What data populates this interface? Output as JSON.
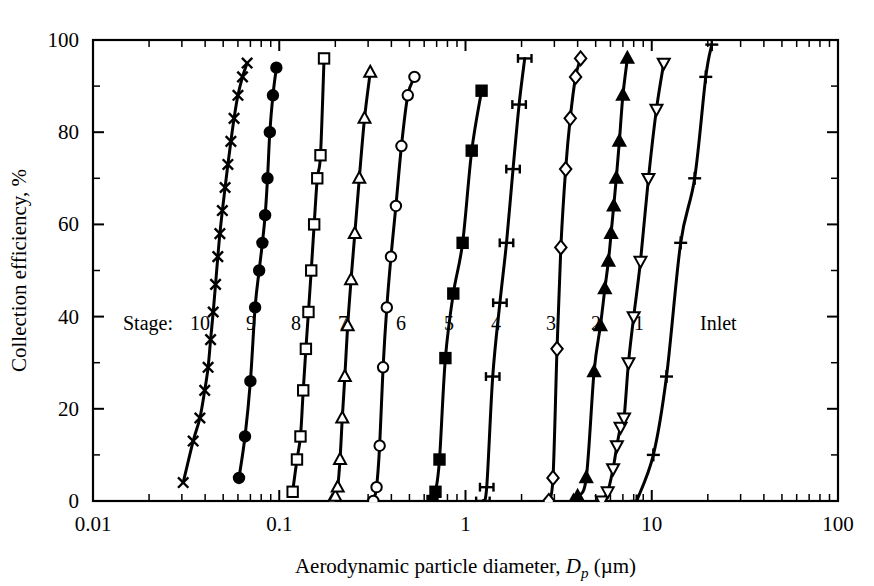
{
  "chart_data": {
    "type": "line",
    "title": "",
    "xlabel": "Aerodynamic particle diameter, D_p (µm)",
    "ylabel": "Collection efficiency, %",
    "xscale": "log",
    "yscale": "linear",
    "xlim": [
      0.01,
      100
    ],
    "ylim": [
      0,
      100
    ],
    "grid": false,
    "legend_position": "inline-annotations",
    "xticks": [
      "0.01",
      "0.1",
      "1",
      "10",
      "100"
    ],
    "xtick_values": [
      0.01,
      0.1,
      1,
      10,
      100
    ],
    "yticks": [
      "0",
      "20",
      "40",
      "60",
      "80",
      "100"
    ],
    "ytick_values": [
      0,
      20,
      40,
      60,
      80,
      100
    ],
    "yminor_values": [
      10,
      30,
      50,
      70,
      90
    ],
    "ticks_on_all_sides": true,
    "stage_prefix_label": "Stage:",
    "series": [
      {
        "name": "10",
        "marker": "x",
        "marker_fill": "none",
        "x": [
          0.0305,
          0.0345,
          0.0375,
          0.0398,
          0.0415,
          0.0428,
          0.0442,
          0.0455,
          0.0468,
          0.048,
          0.0495,
          0.0512,
          0.053,
          0.055,
          0.0572,
          0.06,
          0.0635,
          0.0672
        ],
        "y": [
          4,
          13,
          18,
          24,
          29,
          35,
          41,
          47,
          53,
          58,
          63,
          68,
          73,
          78,
          83,
          88,
          92,
          95
        ]
      },
      {
        "name": "9",
        "marker": "circle",
        "marker_fill": "filled",
        "x": [
          0.0608,
          0.0655,
          0.07,
          0.0742,
          0.078,
          0.0812,
          0.084,
          0.0865,
          0.089,
          0.0925,
          0.0965
        ],
        "y": [
          5,
          14,
          26,
          42,
          50,
          56,
          62,
          70,
          80,
          88,
          94
        ]
      },
      {
        "name": "8",
        "marker": "square",
        "marker_fill": "none",
        "x": [
          0.118,
          0.1245,
          0.13,
          0.1345,
          0.139,
          0.1435,
          0.1485,
          0.154,
          0.16,
          0.1665,
          0.174
        ],
        "y": [
          2,
          9,
          14,
          24,
          33,
          41,
          50,
          60,
          70,
          75,
          96
        ]
      },
      {
        "name": "7",
        "marker": "triangle-up",
        "marker_fill": "none",
        "x": [
          0.192,
          0.2,
          0.206,
          0.212,
          0.218,
          0.225,
          0.233,
          0.243,
          0.2545,
          0.269,
          0.287,
          0.308
        ],
        "y": [
          0,
          1,
          3,
          9,
          18,
          27,
          38,
          48,
          58,
          70,
          83,
          93
        ]
      },
      {
        "name": "6",
        "marker": "circle",
        "marker_fill": "none",
        "x": [
          0.32,
          0.333,
          0.346,
          0.361,
          0.378,
          0.398,
          0.423,
          0.453,
          0.49,
          0.532
        ],
        "y": [
          0,
          3,
          12,
          29,
          42,
          53,
          64,
          77,
          88,
          92
        ]
      },
      {
        "name": "5",
        "marker": "square",
        "marker_fill": "filled",
        "x": [
          0.665,
          0.69,
          0.725,
          0.78,
          0.86,
          0.965,
          1.08,
          1.22
        ],
        "y": [
          0,
          2,
          9,
          31,
          45,
          56,
          76,
          89
        ]
      },
      {
        "name": "4",
        "marker": "hbar",
        "marker_fill": "none",
        "x": [
          1.24,
          1.3,
          1.4,
          1.53,
          1.66,
          1.8,
          1.94,
          2.08
        ],
        "y": [
          0,
          3,
          27,
          43,
          56,
          72,
          86,
          96
        ]
      },
      {
        "name": "3",
        "marker": "diamond",
        "marker_fill": "none",
        "x": [
          2.8,
          2.95,
          3.1,
          3.25,
          3.45,
          3.65,
          3.9,
          4.15
        ],
        "y": [
          0,
          5,
          33,
          55,
          72,
          83,
          92,
          96
        ]
      },
      {
        "name": "2",
        "marker": "triangle-up",
        "marker_fill": "filled",
        "x": [
          3.8,
          4.0,
          4.45,
          4.9,
          5.3,
          5.6,
          5.85,
          6.05,
          6.25,
          6.45,
          6.7,
          7.0,
          7.4
        ],
        "y": [
          0,
          1,
          5,
          28,
          38,
          46,
          52,
          58,
          64,
          70,
          78,
          88,
          96
        ]
      },
      {
        "name": "1",
        "marker": "triangle-down",
        "marker_fill": "none",
        "x": [
          5.4,
          5.8,
          6.2,
          6.5,
          6.8,
          7.1,
          7.5,
          8.0,
          8.7,
          9.6,
          10.6,
          11.6
        ],
        "y": [
          0,
          2,
          7,
          12,
          16,
          18,
          30,
          40,
          52,
          70,
          85,
          95
        ]
      },
      {
        "name": "Inlet",
        "marker": "plus",
        "marker_fill": "none",
        "x": [
          8.3,
          10.2,
          12.0,
          14.3,
          17.0,
          19.5,
          21.0
        ],
        "y": [
          0,
          10,
          27,
          56,
          70,
          92,
          99
        ]
      }
    ],
    "stage_annotations": [
      {
        "label": "Stage:",
        "x_px": 123,
        "y_px": 330
      },
      {
        "label": "10",
        "x_px": 190,
        "y_px": 330
      },
      {
        "label": "9",
        "x_px": 246,
        "y_px": 330
      },
      {
        "label": "8",
        "x_px": 291,
        "y_px": 330
      },
      {
        "label": "7",
        "x_px": 338,
        "y_px": 330
      },
      {
        "label": "6",
        "x_px": 396,
        "y_px": 330
      },
      {
        "label": "5",
        "x_px": 444,
        "y_px": 330
      },
      {
        "label": "4",
        "x_px": 491,
        "y_px": 330
      },
      {
        "label": "3",
        "x_px": 546,
        "y_px": 330
      },
      {
        "label": "2",
        "x_px": 591,
        "y_px": 330
      },
      {
        "label": "1",
        "x_px": 634,
        "y_px": 330
      },
      {
        "label": "Inlet",
        "x_px": 700,
        "y_px": 330
      }
    ],
    "colors": {
      "line": "#000000",
      "axis": "#000000",
      "background": "#ffffff"
    }
  },
  "axis_text": {
    "ylabel": "Collection efficiency, %",
    "xlabel_part1": "Aerodynamic particle diameter, ",
    "xlabel_italic": "D",
    "xlabel_sub": "p",
    "xlabel_part2": " (µm)"
  }
}
